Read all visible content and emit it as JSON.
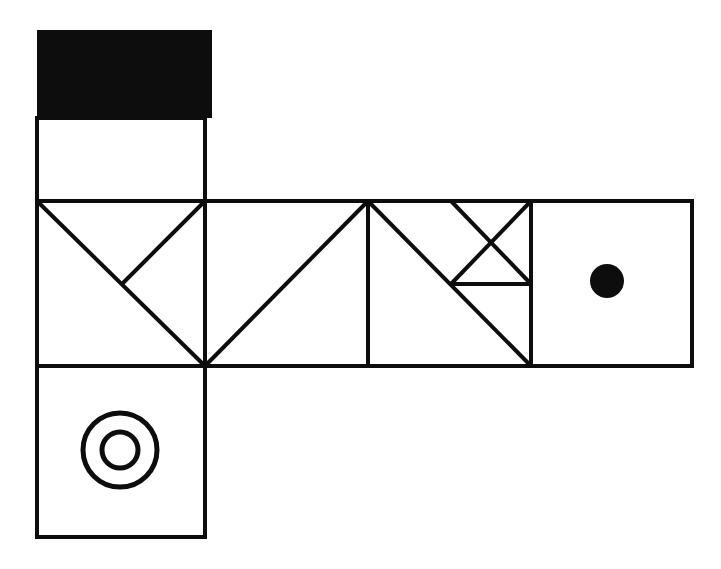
{
  "figure": {
    "canvas": {
      "width": 721,
      "height": 569,
      "background": "#ffffff"
    },
    "ink_color": "#0d0d0d",
    "stroke_width": 4,
    "thin_stroke_width": 4,
    "grid": {
      "cell_size": 167,
      "columns_x": [
        37,
        205,
        368,
        531,
        692
      ],
      "rows_y": [
        30,
        118,
        201,
        366,
        537
      ]
    },
    "faces": [
      {
        "id": "face-top-black",
        "name": "top-black-band",
        "marking": "solid-black-rectangle",
        "x": 37,
        "y": 30,
        "width": 175,
        "height": 88,
        "color": "#0d0d0d"
      },
      {
        "id": "face-top-blank",
        "name": "upper-blank-square",
        "marking": "blank",
        "x": 37,
        "y": 118,
        "width": 168,
        "height": 83
      },
      {
        "id": "face-middle-1",
        "name": "middle-cell-1-double-diagonal",
        "marking": "diagonal-with-half-diagonal",
        "x": 37,
        "y": 201,
        "width": 168,
        "height": 165
      },
      {
        "id": "face-middle-2",
        "name": "middle-cell-2-single-diagonal",
        "marking": "single-diagonal",
        "x": 205,
        "y": 201,
        "width": 163,
        "height": 165
      },
      {
        "id": "face-middle-3",
        "name": "middle-cell-3-tangram",
        "marking": "diagonal-with-crossed-triangles",
        "x": 368,
        "y": 201,
        "width": 163,
        "height": 165
      },
      {
        "id": "face-middle-4",
        "name": "middle-cell-4-filled-dot",
        "marking": "filled-circle",
        "x": 531,
        "y": 201,
        "width": 161,
        "height": 165
      },
      {
        "id": "face-bottom",
        "name": "bottom-cell-concentric-circles",
        "marking": "concentric-circles",
        "x": 37,
        "y": 366,
        "width": 168,
        "height": 171
      }
    ],
    "marks": {
      "filled_dot": {
        "cx": 607,
        "cy": 281,
        "r": 17,
        "color": "#0d0d0d"
      },
      "outer_ring": {
        "cx": 120,
        "cy": 450,
        "r": 37,
        "stroke_width": 5
      },
      "inner_ring": {
        "cx": 120,
        "cy": 450,
        "r": 18,
        "stroke_width": 5
      }
    },
    "diagonals": [
      {
        "name": "cell1-main-diagonal",
        "x1": 37,
        "y1": 201,
        "x2": 205,
        "y2": 366
      },
      {
        "name": "cell1-corner-diagonal",
        "x1": 205,
        "y1": 201,
        "x2": 122,
        "y2": 284
      },
      {
        "name": "cell2-main-diagonal",
        "x1": 205,
        "y1": 366,
        "x2": 368,
        "y2": 201
      },
      {
        "name": "cell3-main-diagonal",
        "x1": 368,
        "y1": 201,
        "x2": 531,
        "y2": 366
      },
      {
        "name": "cell3-upper-right-down",
        "x1": 451,
        "y1": 201,
        "x2": 531,
        "y2": 284
      },
      {
        "name": "cell3-right-edge-down-left",
        "x1": 531,
        "y1": 201,
        "x2": 451,
        "y2": 284
      },
      {
        "name": "cell3-mid-to-diagonal",
        "x1": 451,
        "y1": 284,
        "x2": 531,
        "y2": 284
      }
    ],
    "dividers": [
      {
        "name": "divider-col-1",
        "x1": 205,
        "y1": 201,
        "x2": 205,
        "y2": 366
      },
      {
        "name": "divider-col-2",
        "x1": 368,
        "y1": 201,
        "x2": 368,
        "y2": 366
      },
      {
        "name": "divider-col-3",
        "x1": 531,
        "y1": 201,
        "x2": 531,
        "y2": 366
      }
    ]
  }
}
